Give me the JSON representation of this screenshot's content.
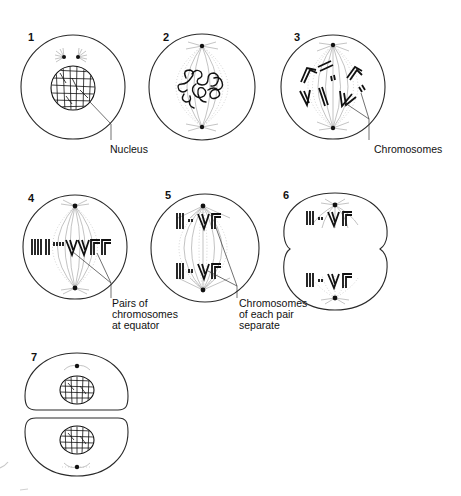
{
  "figure": {
    "stages": [
      {
        "number": "1",
        "label": "",
        "annotation": "Nucleus"
      },
      {
        "number": "2",
        "label": "",
        "annotation": ""
      },
      {
        "number": "3",
        "label": "",
        "annotation": "Chromosomes"
      },
      {
        "number": "4",
        "label": "",
        "annotation_lines": [
          "Pairs of",
          "chromosomes",
          "at equator"
        ]
      },
      {
        "number": "5",
        "label": "",
        "annotation_lines": [
          "Chromosomes",
          "of each pair",
          "separate"
        ]
      },
      {
        "number": "6",
        "label": "",
        "annotation": ""
      },
      {
        "number": "7",
        "label": "",
        "annotation": ""
      }
    ]
  },
  "labels": {
    "nucleus": "Nucleus",
    "chromosomes": "Chromosomes",
    "pairs": [
      "Pairs of",
      "chromosomes",
      "at equator"
    ],
    "separate": [
      "Chromosomes",
      "of each pair",
      "separate"
    ]
  },
  "colors": {
    "ink": "#111111",
    "spindle": "#9a9a9a",
    "background": "#ffffff"
  }
}
